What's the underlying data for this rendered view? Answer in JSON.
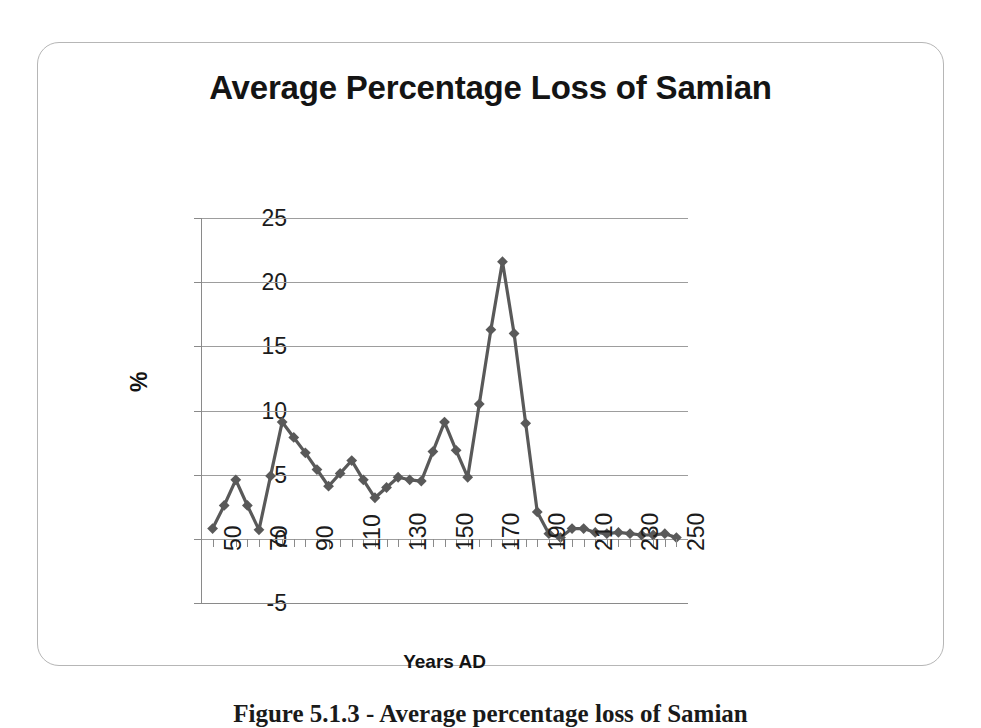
{
  "figure": {
    "caption": "Figure 5.1.3 - Average percentage loss of Samian"
  },
  "chart": {
    "title": "Average Percentage Loss of Samian",
    "xlabel": "Years AD",
    "ylabel": "%",
    "line_color": "#595959",
    "marker_color": "#595959",
    "grid_color": "#9d9d9d",
    "axis_color": "#8a8a8a"
  },
  "chart_data": {
    "type": "line",
    "title": "Average Percentage Loss of Samian",
    "xlabel": "Years AD",
    "ylabel": "%",
    "xlim": [
      45,
      255
    ],
    "ylim": [
      -5,
      25
    ],
    "yticks": [
      -5,
      0,
      5,
      10,
      15,
      20,
      25
    ],
    "xticks": [
      50,
      70,
      90,
      110,
      130,
      150,
      170,
      190,
      210,
      230,
      250
    ],
    "xtick_labels": [
      "50",
      "70",
      "90",
      "110",
      "130",
      "150",
      "170",
      "190",
      "210",
      "230",
      "250"
    ],
    "ytick_labels": [
      "-5",
      "0",
      "5",
      "10",
      "15",
      "20",
      "25"
    ],
    "grid": true,
    "grid_axis": "y",
    "legend": false,
    "marker": "diamond",
    "x": [
      50,
      55,
      60,
      65,
      70,
      75,
      80,
      85,
      90,
      95,
      100,
      105,
      110,
      115,
      120,
      125,
      130,
      135,
      140,
      145,
      150,
      155,
      160,
      165,
      170,
      175,
      180,
      185,
      190,
      195,
      200,
      205,
      210,
      215,
      220,
      225,
      230,
      235,
      240,
      245,
      250
    ],
    "y": [
      0.8,
      2.6,
      4.6,
      2.6,
      0.7,
      4.9,
      9.1,
      7.9,
      6.7,
      5.4,
      4.1,
      5.1,
      6.1,
      4.6,
      3.2,
      4.0,
      4.8,
      4.6,
      4.5,
      6.8,
      9.1,
      6.9,
      4.8,
      10.5,
      16.3,
      21.6,
      16.0,
      9.0,
      2.1,
      0.4,
      0.1,
      0.8,
      0.8,
      0.5,
      0.4,
      0.5,
      0.4,
      0.3,
      0.3,
      0.4,
      0.1
    ],
    "series": [
      {
        "name": "Average percentage loss of Samian",
        "values": [
          0.8,
          2.6,
          4.6,
          2.6,
          0.7,
          4.9,
          9.1,
          7.9,
          6.7,
          5.4,
          4.1,
          5.1,
          6.1,
          4.6,
          3.2,
          4.0,
          4.8,
          4.6,
          4.5,
          6.8,
          9.1,
          6.9,
          4.8,
          10.5,
          16.3,
          21.6,
          16.0,
          9.0,
          2.1,
          0.4,
          0.1,
          0.8,
          0.8,
          0.5,
          0.4,
          0.5,
          0.4,
          0.3,
          0.3,
          0.4,
          0.1
        ]
      }
    ],
    "annotations": []
  }
}
